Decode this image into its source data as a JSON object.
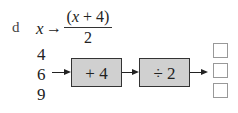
{
  "question": {
    "label": "d",
    "mapping": {
      "variable": "x",
      "arrow": "→",
      "numerator_open": "(",
      "numerator_var": "x",
      "numerator_rest": " + 4)",
      "denominator": "2"
    },
    "inputs": [
      "4",
      "6",
      "9"
    ],
    "operations": [
      {
        "label": "+ 4"
      },
      {
        "label": "÷ 2"
      }
    ],
    "answers": [
      "",
      "",
      ""
    ],
    "colors": {
      "box_fill": "#d0d0d0",
      "box_border": "#333333",
      "answer_border": "#999999"
    }
  }
}
